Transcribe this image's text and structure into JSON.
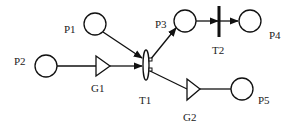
{
  "diagram": {
    "type": "petri-net",
    "places": [
      {
        "id": "P1",
        "label": "P1"
      },
      {
        "id": "P2",
        "label": "P2"
      },
      {
        "id": "P3",
        "label": "P3"
      },
      {
        "id": "P4",
        "label": "P4"
      },
      {
        "id": "P5",
        "label": "P5"
      }
    ],
    "transitions": [
      {
        "id": "T1",
        "label": "T1"
      },
      {
        "id": "T2",
        "label": "T2"
      }
    ],
    "gates": [
      {
        "id": "G1",
        "label": "G1"
      },
      {
        "id": "G2",
        "label": "G2"
      }
    ],
    "arcs": [
      {
        "from": "P1",
        "to": "T1"
      },
      {
        "from": "P2",
        "to": "G1"
      },
      {
        "from": "G1",
        "to": "T1"
      },
      {
        "from": "T1",
        "to": "P3"
      },
      {
        "from": "T1",
        "to": "G2"
      },
      {
        "from": "G2",
        "to": "P5"
      },
      {
        "from": "P3",
        "to": "T2"
      },
      {
        "from": "T2",
        "to": "P4"
      }
    ]
  }
}
